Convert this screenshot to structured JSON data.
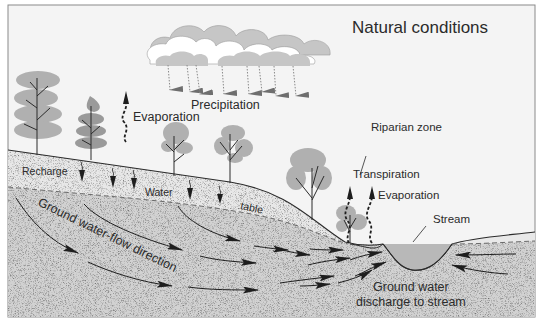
{
  "diagram": {
    "title": "Natural conditions",
    "labels": {
      "precipitation": "Precipitation",
      "evaporation_left": "Evaporation",
      "riparian_zone": "Riparian zone",
      "transpiration": "Transpiration",
      "evaporation_right": "Evaporation",
      "stream": "Stream",
      "recharge": "Recharge",
      "water_table_1": "Water",
      "water_table_2": "table",
      "flow_direction": "Ground water-flow direction",
      "discharge_1": "Ground water",
      "discharge_2": "discharge to stream"
    },
    "colors": {
      "sky": "#f4f4f4",
      "unsaturated_zone": "#e8e8e8",
      "saturated_zone": "#d2d2d2",
      "stream_water": "#b8b8b8",
      "tree_foliage": "#b0b0b0",
      "tree_foliage_dark": "#9a9a9a",
      "cloud_shadow": "#c6c6c6",
      "cloud_light": "#ffffff",
      "line": "#2b2b2b",
      "border": "#8a8a8a"
    },
    "icons": {
      "cloud": "cloud-icon",
      "rain_arrow": "rain-arrow-icon",
      "tree": "tree-icon",
      "evaporation_arrow": "wavy-up-arrow-icon",
      "recharge_arrow": "wavy-down-arrow-icon",
      "flow_arrow": "curved-flow-arrow-icon"
    }
  }
}
